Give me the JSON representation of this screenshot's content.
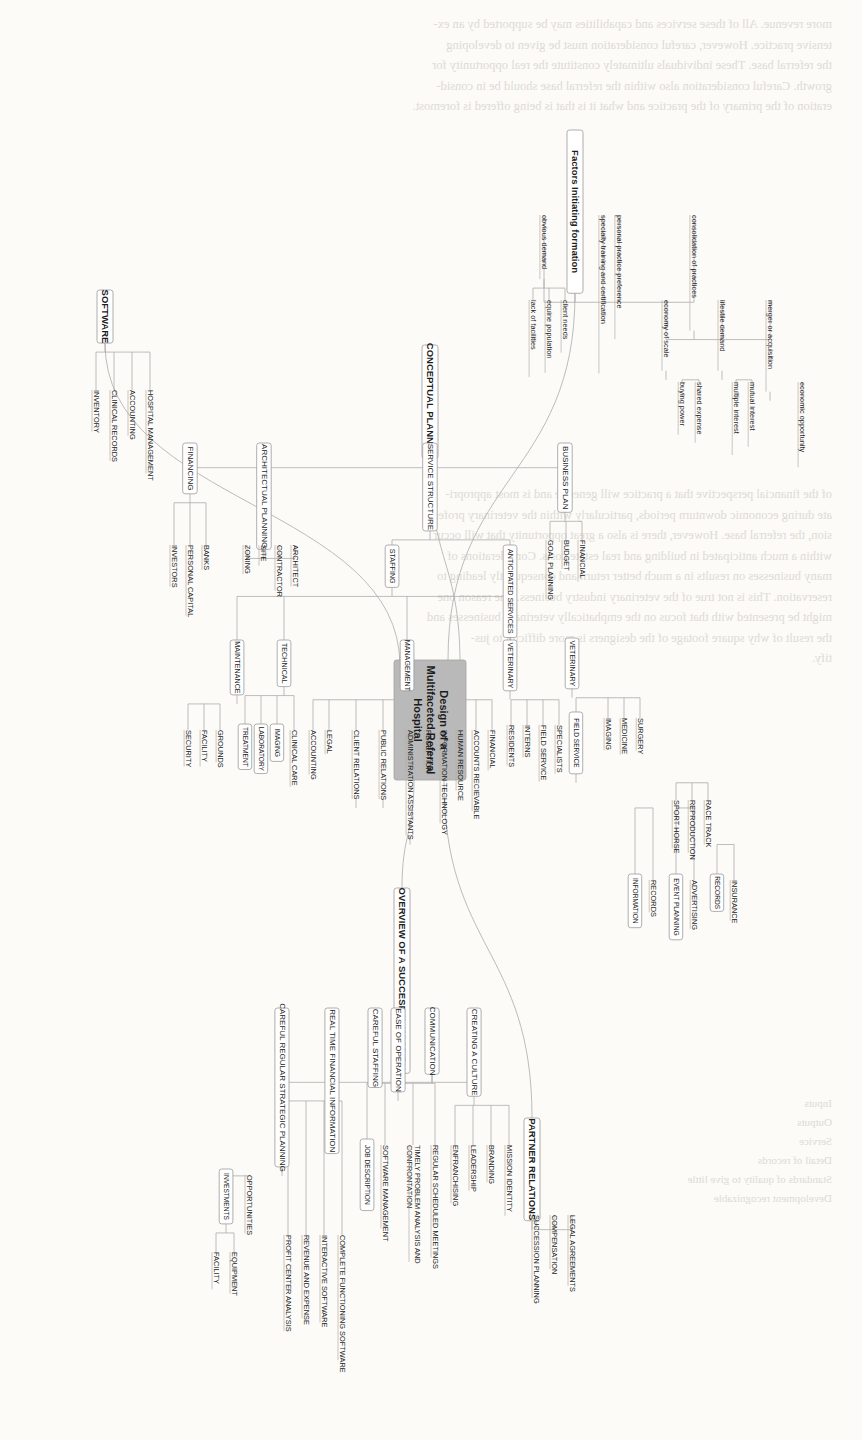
{
  "document": {
    "background_text_blocks": [
      "more revenue. All of these services and capabilities may be supported by an ex-\ntensive practice. However, careful consideration must be given to developing\nthe referral base. These individuals ultimately constitute the real opportunity for\ngrowth. Careful consideration also within the referral base should be in consid-\neration of the primary of the practice and what it is that is being offered is foremost.",
      "of the financial perspective that a practice will generate and is most appropri-\nate during economic downturn periods, particularly within the veterinary profes-\nsion, the referral base. However, there is also a great opportunity that will occur\nwithin a much anticipated in building and real estate costs. Considerations of\nmany businesses on results in a much better return and consequently leading to\nreservation. This is not true of the veterinary industry business. The reason one\nmight be presented with that focus on the emphatically veterinary businesses and\nthe result of why square footage of the designers is more difficult to jus-\ntify.",
      "Inputs\nOutputs\nService\nDetail of records\nStandards of quality to give little\nDevelopment recognizable"
    ]
  },
  "diagram": {
    "type": "mind-map",
    "orientation": "rotated-90-clockwise",
    "root": {
      "id": "root",
      "label": "Design of a\nMultifaceted Referral\nHospital",
      "fill": "#b9b9b9"
    },
    "branches": [
      {
        "id": "factors",
        "label": "Factors Initiating formation",
        "children": [
          {
            "label": "consolidation of practices",
            "children": [
              {
                "label": "merger or acquisition",
                "children": [
                  {
                    "label": "economic opportunity"
                  }
                ]
              },
              {
                "label": "lifestile demand",
                "children": [
                  {
                    "label": "mutual interest"
                  },
                  {
                    "label": "multiple interest"
                  }
                ]
              },
              {
                "label": "economy of scale",
                "children": [
                  {
                    "label": "shared expense"
                  },
                  {
                    "label": "buying power"
                  }
                ]
              }
            ]
          },
          {
            "label": "personal practice preference"
          },
          {
            "label": "specialty training and certification"
          },
          {
            "label": "obvious demand",
            "children": [
              {
                "label": "client needs"
              },
              {
                "label": "equine population"
              },
              {
                "label": "lack of facilities"
              }
            ]
          }
        ]
      },
      {
        "id": "conceptual",
        "label": "CONCEPTUAL PLANNING",
        "children": [
          {
            "label": "BUSINESS PLAN",
            "children": [
              {
                "label": "FINANCIAL"
              },
              {
                "label": "BUDGET"
              },
              {
                "label": "GOAL PLANNING"
              }
            ]
          },
          {
            "label": "SERVICE STRUCTURE",
            "children": [
              {
                "label": "ANTICIPATED SERVICES",
                "children": [
                  {
                    "label": "VETERINARY",
                    "children": [
                      {
                        "label": "SURGERY"
                      },
                      {
                        "label": "MEDICINE"
                      },
                      {
                        "label": "IMAGING"
                      },
                      {
                        "label": "FIELD SERVICE",
                        "children": [
                          {
                            "label": "RACE TRACK"
                          },
                          {
                            "label": "REPRODUCTION"
                          },
                          {
                            "label": "SPORT HORSE"
                          }
                        ]
                      }
                    ]
                  }
                ]
              },
              {
                "label": "STAFFING",
                "children": [
                  {
                    "label": "VETERINARY",
                    "children": [
                      {
                        "label": "SPECIALISTS"
                      },
                      {
                        "label": "FIELD SERVICE"
                      },
                      {
                        "label": "INTERNS"
                      },
                      {
                        "label": "RESIDENTS"
                      }
                    ]
                  },
                  {
                    "label": "MANAGEMENT",
                    "children": [
                      {
                        "label": "FINANCIAL"
                      },
                      {
                        "label": "ACCOUNTS RECIEVABLE"
                      },
                      {
                        "label": "HUMAN RESOURCE"
                      },
                      {
                        "label": "INFORMATION TECHNOLOGY"
                      },
                      {
                        "label": "RECEPTION"
                      },
                      {
                        "label": "ADMINISTRATION ASSISTANTS",
                        "children": [
                          {
                            "label": "INSURANCE"
                          },
                          {
                            "label": "RECORDS"
                          }
                        ]
                      },
                      {
                        "label": "PUBLIC RELATIONS",
                        "children": [
                          {
                            "label": "ADVERTISING"
                          },
                          {
                            "label": "EVENT PLANNING"
                          }
                        ]
                      },
                      {
                        "label": "CLIENT RELATIONS",
                        "children": [
                          {
                            "label": "RECORDS"
                          },
                          {
                            "label": "INFORMATION"
                          }
                        ]
                      },
                      {
                        "label": "LEGAL"
                      },
                      {
                        "label": "ACCOUNTING"
                      }
                    ]
                  },
                  {
                    "label": "TECHNICAL",
                    "children": [
                      {
                        "label": "CLINICAL CARE"
                      },
                      {
                        "label": "IMAGING"
                      },
                      {
                        "label": "LABORATORY"
                      },
                      {
                        "label": "TREATMENT"
                      }
                    ]
                  },
                  {
                    "label": "MAINTENANCE",
                    "children": [
                      {
                        "label": "GROUNDS"
                      },
                      {
                        "label": "FACILITY"
                      },
                      {
                        "label": "SECURITY"
                      }
                    ]
                  }
                ]
              }
            ]
          },
          {
            "label": "ARCHITECTUAL PLANNING",
            "children": [
              {
                "label": "ARCHITECT"
              },
              {
                "label": "CONTRACTOR"
              },
              {
                "label": "SITE"
              },
              {
                "label": "ZONING"
              }
            ]
          },
          {
            "label": "FINANCING",
            "children": [
              {
                "label": "BANKS"
              },
              {
                "label": "PERSONAL CAPITAL"
              },
              {
                "label": "INVESTORS"
              }
            ]
          }
        ]
      },
      {
        "id": "software",
        "label": "SOFTWARE",
        "children": [
          {
            "label": "HOSPITAL MANAGEMENT"
          },
          {
            "label": "ACCOUNTING"
          },
          {
            "label": "CLINICAL RECORDS"
          },
          {
            "label": "INVENTORY"
          }
        ]
      },
      {
        "id": "partner",
        "label": "PARTNER RELATIONS",
        "children": [
          {
            "label": "LEGAL AGREEMENTS"
          },
          {
            "label": "COMPENSATION"
          },
          {
            "label": "SUCCESSION PLANNING"
          }
        ]
      },
      {
        "id": "overview",
        "label": "OVERVIEW OF A SUCCESFUL HOSPITAL",
        "children": [
          {
            "label": "CREATING A CULTURE",
            "children": [
              {
                "label": "MISSION IDENTITY"
              },
              {
                "label": "BRANDING"
              },
              {
                "label": "LEADERSHIP"
              },
              {
                "label": "ENFRANCHISING"
              }
            ]
          },
          {
            "label": "COMMUNICATION",
            "children": [
              {
                "label": "REGULAR SCHEDULED MEETINGS"
              },
              {
                "label": "TIMELY PROBLEM ANALYSIS AND\nCONFRONTATION"
              },
              {
                "label": "SOFTWARE MANAGEMENT"
              },
              {
                "label": "JOB DESCRIPTION"
              }
            ]
          },
          {
            "label": "EASE OF OPERATION",
            "children": [
              {
                "label": "COMPLETE FUNCTIONING SOFTWARE"
              },
              {
                "label": "INTERACTIVE SOFTWARE"
              },
              {
                "label": "REVENUE AND EXPENSE"
              },
              {
                "label": "PROFIT CENTER ANALYSIS"
              }
            ]
          },
          {
            "label": "CAREFUL STAFFING"
          },
          {
            "label": "REAL TIME FINANCIAL INFORMATION"
          },
          {
            "label": "CAREFUL REGULAR STRATEGIC PLANNING",
            "children": [
              {
                "label": "OPPORTUNITIES"
              },
              {
                "label": "INVESTMENTS",
                "children": [
                  {
                    "label": "EQUIPMENT"
                  },
                  {
                    "label": "FACILITY"
                  }
                ]
              }
            ]
          }
        ]
      }
    ]
  }
}
